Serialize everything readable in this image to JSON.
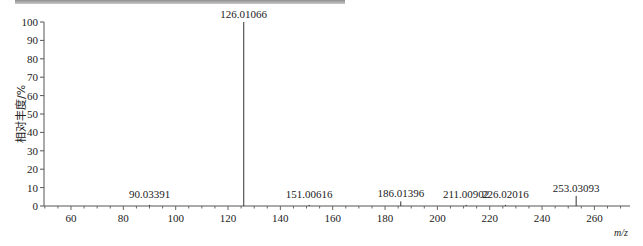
{
  "chart_data": {
    "type": "bar",
    "subtype": "mass-spectrum-stick",
    "title": "",
    "xlabel": "m/z",
    "ylabel": "相对丰度/%",
    "xlim": [
      50,
      274
    ],
    "ylim": [
      0,
      100
    ],
    "x_ticks": [
      60,
      80,
      100,
      120,
      140,
      160,
      180,
      200,
      220,
      240,
      260
    ],
    "y_ticks": [
      0,
      10,
      20,
      30,
      40,
      50,
      60,
      70,
      80,
      90,
      100
    ],
    "grid": false,
    "legend": null,
    "peaks": [
      {
        "mz": 90.03391,
        "intensity": 0.6,
        "label": "90.03391"
      },
      {
        "mz": 126.01066,
        "intensity": 100,
        "label": "126.01066"
      },
      {
        "mz": 151.00616,
        "intensity": 0.6,
        "label": "151.00616"
      },
      {
        "mz": 186.01396,
        "intensity": 2.5,
        "label": "186.01396"
      },
      {
        "mz": 211.00902,
        "intensity": 0.6,
        "label": "211.00902"
      },
      {
        "mz": 226.02016,
        "intensity": 0.6,
        "label": "226.02016"
      },
      {
        "mz": 253.03093,
        "intensity": 5.5,
        "label": "253.03093"
      }
    ]
  },
  "axis": {
    "ylabel": "相对丰度/%",
    "xunit": "m/z"
  }
}
